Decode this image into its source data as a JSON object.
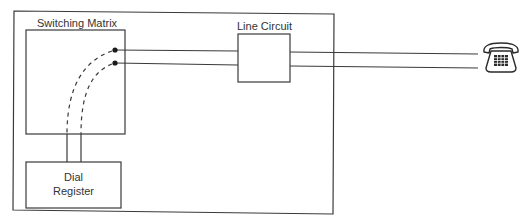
{
  "diagram": {
    "type": "telephone switching block diagram",
    "colors": {
      "line": "#3a3a3a",
      "background": "#ffffff",
      "text": "#333333"
    },
    "blocks": {
      "switching_matrix": {
        "label": "Switching Matrix"
      },
      "line_circuit": {
        "label": "Line Circuit"
      },
      "dial_register": {
        "label_line1": "Dial",
        "label_line2": "Register"
      }
    },
    "endpoint": {
      "icon": "telephone-icon"
    },
    "connections": [
      {
        "from": "switching_matrix",
        "to": "line_circuit",
        "style": "solid",
        "wires": 2
      },
      {
        "from": "line_circuit",
        "to": "telephone",
        "style": "solid",
        "wires": 2
      },
      {
        "from": "switching_matrix",
        "to": "dial_register",
        "style": "dashed-to-solid",
        "wires": 2
      }
    ]
  }
}
